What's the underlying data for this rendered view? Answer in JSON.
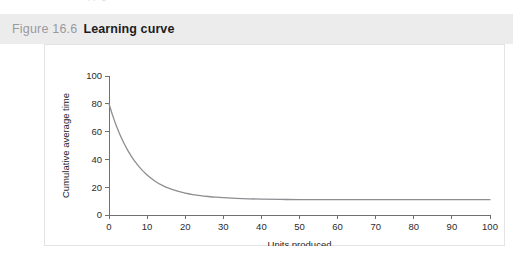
{
  "page": {
    "background_color": "#ffffff",
    "top_bleed_text": "pp                    g"
  },
  "figure": {
    "number_label": "Figure 16.6",
    "title": "Learning curve",
    "header_bg_color": "#ececed",
    "number_color": "#9a9a9e",
    "title_color": "#1d1d1f",
    "card_bg_color": "#ffffff",
    "card_border_color": "#e4e4e6"
  },
  "chart_data": {
    "type": "line",
    "title": "Learning curve",
    "xlabel": "Units produced",
    "ylabel": "Cumulative average time",
    "xlim": [
      0,
      100
    ],
    "ylim": [
      0,
      100
    ],
    "xticks": [
      0,
      10,
      20,
      30,
      40,
      50,
      60,
      70,
      80,
      90,
      100
    ],
    "xticklabels": [
      "0",
      "10",
      "20",
      "30",
      "40",
      "50",
      "60",
      "70",
      "80",
      "90",
      "100"
    ],
    "yticks": [
      0,
      20,
      40,
      60,
      80,
      100
    ],
    "yticklabels": [
      "0",
      "20",
      "40",
      "60",
      "80",
      "100"
    ],
    "grid": false,
    "legend": null,
    "line_color": "#8d8d92",
    "axis_color": "#6f6f74",
    "series": [
      {
        "name": "Cumulative average time",
        "x": [
          0,
          1,
          2,
          3,
          4,
          5,
          6,
          7,
          8,
          9,
          10,
          12,
          14,
          16,
          18,
          20,
          22,
          24,
          26,
          28,
          30,
          35,
          40,
          45,
          50,
          60,
          70,
          80,
          90,
          100
        ],
        "values": [
          80.0,
          71.3,
          63.6,
          57.0,
          51.2,
          46.1,
          41.7,
          37.8,
          34.4,
          31.4,
          28.8,
          24.5,
          21.3,
          18.9,
          17.1,
          15.7,
          14.7,
          13.9,
          13.3,
          12.8,
          12.5,
          11.8,
          11.4,
          11.2,
          11.1,
          11.0,
          11.0,
          11.0,
          11.0,
          11.0
        ]
      }
    ]
  }
}
